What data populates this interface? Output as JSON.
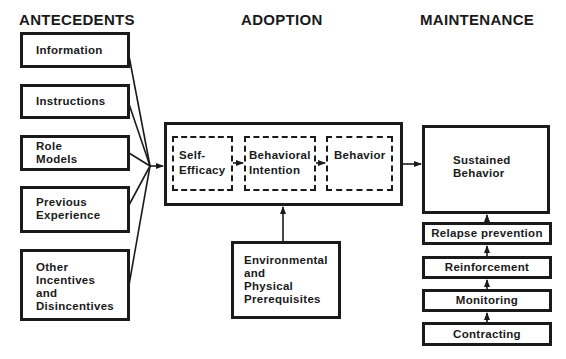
{
  "headers": {
    "antecedents": "ANTECEDENTS",
    "adoption": "ADOPTION",
    "maintenance": "MAINTENANCE"
  },
  "antecedents": [
    {
      "label": "Information"
    },
    {
      "label": "Instructions"
    },
    {
      "label": "Role\nModels"
    },
    {
      "label": "Previous\nExperience"
    },
    {
      "label": "Other\nIncentives\nand\nDisincentives"
    }
  ],
  "adoption": {
    "stages": [
      {
        "label": "Self-\nEfficacy"
      },
      {
        "label": "Behavioral\nIntention"
      },
      {
        "label": "Behavior"
      }
    ],
    "environment": {
      "label": "Environmental\nand\nPhysical\nPrerequisites"
    }
  },
  "maintenance": {
    "sustained": {
      "label": "Sustained\nBehavior"
    },
    "steps": [
      {
        "label": "Relapse prevention"
      },
      {
        "label": "Reinforcement"
      },
      {
        "label": "Monitoring"
      },
      {
        "label": "Contracting"
      }
    ]
  },
  "colors": {
    "ink": "#1a1a1a",
    "background": "#ffffff"
  }
}
